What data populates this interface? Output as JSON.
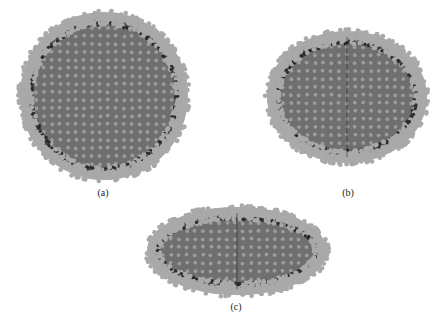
{
  "figure": {
    "background": "#ffffff",
    "colors": {
      "interior": "#6f6f6f",
      "interior_dot": "#9c9c9c",
      "rim_dot": "#a9a9a9",
      "rim_shadow": "#2b2b2b",
      "rim_mid": "#555555"
    },
    "panels": [
      {
        "id": "a",
        "label": "(a)",
        "shape": "sphere",
        "cx": 104,
        "cy": 96,
        "rx": 84,
        "ry": 84,
        "label_x": 103,
        "label_y": 188,
        "meridian": false
      },
      {
        "id": "b",
        "label": "(b)",
        "shape": "oblate-ellipsoid",
        "cx": 347,
        "cy": 97,
        "rx": 80,
        "ry": 66,
        "label_x": 348,
        "label_y": 188,
        "meridian": true
      },
      {
        "id": "c",
        "label": "(c)",
        "shape": "flattened-ellipsoid",
        "cx": 237,
        "cy": 251,
        "rx": 90,
        "ry": 44,
        "label_x": 236,
        "label_y": 302,
        "meridian": true
      }
    ]
  }
}
